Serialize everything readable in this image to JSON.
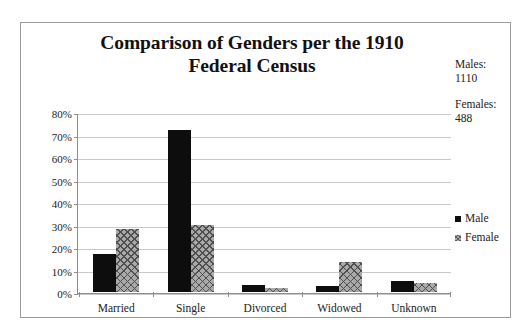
{
  "chart_data": {
    "type": "bar",
    "title": "Comparison of Genders per the 1910 Federal Census",
    "title_line1": "Comparison of Genders per the 1910",
    "title_line2": "Federal Census",
    "categories": [
      "Married",
      "Single",
      "Divorced",
      "Widowed",
      "Unknown"
    ],
    "series": [
      {
        "name": "Male",
        "values": [
          17,
          72,
          3,
          2.5,
          5
        ]
      },
      {
        "name": "Female",
        "values": [
          28,
          30,
          2,
          13.5,
          4
        ]
      }
    ],
    "xlabel": "",
    "ylabel": "",
    "ylim": [
      0,
      80
    ],
    "ytick_labels": [
      "80%",
      "70%",
      "60%",
      "50%",
      "40%",
      "30%",
      "20%",
      "10%",
      "0%"
    ],
    "ytick_values": [
      80,
      70,
      60,
      50,
      40,
      30,
      20,
      10,
      0
    ],
    "value_suffix": "%",
    "grid": true,
    "legend_position": "right",
    "colors": {
      "male": "#0d0d0d",
      "female": "#a9a9a9",
      "female_hatch": "#4f4f4f",
      "gridline": "#c9c9c9",
      "axis": "#8c8c8c",
      "border": "#9a9a9a",
      "text": "#222222",
      "background": "#ffffff"
    }
  },
  "annotations": {
    "males": {
      "label": "Males:",
      "value": "1110"
    },
    "females": {
      "label": "Females:",
      "value": "488"
    }
  },
  "legend": {
    "items": [
      {
        "label": "Male",
        "marker": "solid-square-icon"
      },
      {
        "label": "Female",
        "marker": "crosshatch-square-icon"
      }
    ]
  }
}
